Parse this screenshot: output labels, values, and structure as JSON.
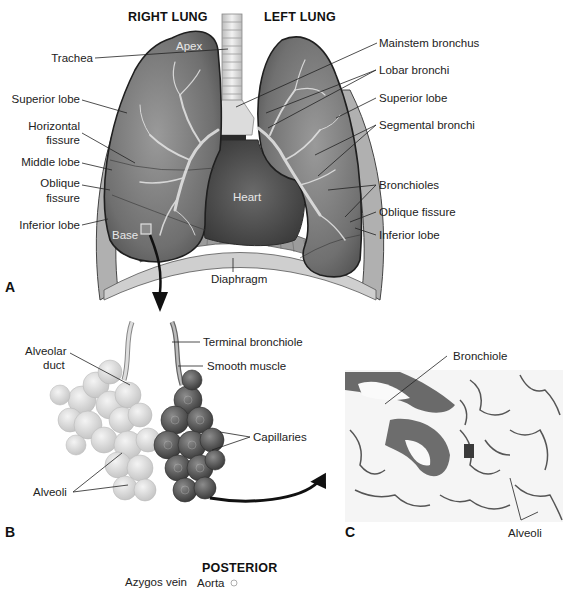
{
  "panel_a": {
    "letter": "A",
    "headers": {
      "right": "RIGHT LUNG",
      "left": "LEFT LUNG"
    },
    "inner_labels": {
      "apex": "Apex",
      "base": "Base",
      "heart": "Heart"
    },
    "left_labels": [
      "Trachea",
      "Superior lobe",
      "Horizontal",
      "fissure",
      "Middle lobe",
      "Oblique",
      "fissure",
      "Inferior lobe"
    ],
    "right_labels": [
      "Mainstem bronchus",
      "Lobar bronchi",
      "Superior lobe",
      "Segmental bronchi",
      "Bronchioles",
      "Oblique fissure",
      "Inferior lobe"
    ],
    "bottom_label": "Diaphragm"
  },
  "panel_b": {
    "letter": "B",
    "labels": {
      "alveolar_duct_1": "Alveolar",
      "alveolar_duct_2": "duct",
      "terminal_bronchiole": "Terminal bronchiole",
      "smooth_muscle": "Smooth muscle",
      "capillaries": "Capillaries",
      "alveoli": "Alveoli"
    }
  },
  "panel_c": {
    "letter": "C",
    "labels": {
      "bronchiole": "Bronchiole",
      "alveoli": "Alveoli"
    }
  },
  "panel_d": {
    "header": "POSTERIOR",
    "labels": {
      "azygos_vein": "Azygos vein",
      "aorta": "Aorta"
    }
  }
}
